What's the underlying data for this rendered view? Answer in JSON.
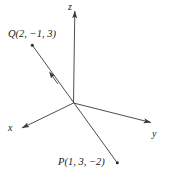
{
  "figure": {
    "type": "3d-coordinate-axes-with-line",
    "stroke_color": "#3a3a3a",
    "text_color": "#1a1a1a",
    "background_color": "#ffffff"
  },
  "axes": {
    "z": {
      "label": "z",
      "direction": "up"
    },
    "y": {
      "label": "y",
      "direction": "right-down"
    },
    "x": {
      "label": "x",
      "direction": "left-down"
    }
  },
  "points": {
    "q": {
      "label": "Q(2, −1, 3)",
      "name": "Q",
      "coordinates": [
        2,
        -1,
        3
      ]
    },
    "p": {
      "label": "P(1, 3, −2)",
      "name": "P",
      "coordinates": [
        1,
        3,
        -2
      ]
    }
  },
  "line": {
    "from": "P",
    "to": "Q",
    "arrow_direction": "toward-Q",
    "passes_through_origin": true
  }
}
